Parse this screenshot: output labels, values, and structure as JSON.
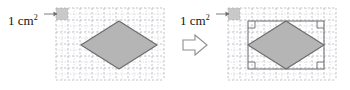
{
  "figure": {
    "colors": {
      "shape_fill": "#b5b5b5",
      "shape_stroke": "#6b6b6b",
      "unit_cell_fill": "#c9c9c9",
      "grid_minor": "#c4c4cf",
      "grid_major": "#9a9aa8",
      "rectangle_stroke": "#6b6b6b",
      "arrow_stroke": "#8a8a8a",
      "text": "#141414"
    },
    "grid": {
      "cell_size_px": 12,
      "minor_per_cell": 2,
      "unit_cell_meaning": "1 cm squared"
    },
    "panels": [
      {
        "id": "left",
        "label": "1 cm",
        "label_exponent": "2",
        "label_arrow": "right-arrow",
        "grid": {
          "x": 56,
          "y": 8,
          "cols": 9,
          "rows": 6
        },
        "unit_cell": {
          "col": 0,
          "row": 0
        },
        "rhombus": {
          "cx": 119,
          "cy": 45,
          "half_width": 38,
          "half_height": 24
        },
        "has_bounding_rectangle": false,
        "right_angle_markers": 0
      },
      {
        "id": "right",
        "label": "1 cm",
        "label_exponent": "2",
        "label_arrow": "right-arrow",
        "grid": {
          "x": 228,
          "y": 8,
          "cols": 9,
          "rows": 6
        },
        "unit_cell": {
          "col": 0,
          "row": 0
        },
        "rhombus": {
          "cx": 286,
          "cy": 45,
          "half_width": 38,
          "half_height": 24
        },
        "has_bounding_rectangle": true,
        "bounding_rectangle": {
          "x": 248,
          "y": 21,
          "width": 76,
          "height": 48
        },
        "right_angle_markers": 4
      }
    ],
    "transform_arrow": {
      "symbol": "block-arrow-right",
      "x": 190,
      "y": 37
    }
  }
}
